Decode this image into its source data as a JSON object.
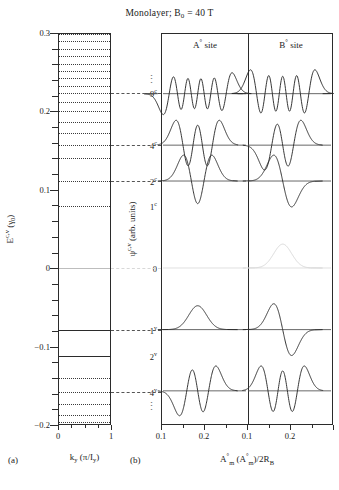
{
  "title": {
    "text": "Monolayer; B",
    "sub": "0",
    "tail": " = 40 T"
  },
  "panel_a": {
    "caption": "(a)",
    "ylabel_main": "E",
    "ylabel_sup": "c,v",
    "ylabel_unit": " (γ",
    "ylabel_unit_sub": "0",
    "ylabel_unit_end": ")",
    "yticks": [
      "0.3",
      "0.2",
      "0.1",
      "0",
      "-0.1",
      "-0.2"
    ],
    "xticks": [
      "0",
      "1"
    ],
    "xtitle_main": "k",
    "xtitle_sub": "y",
    "xtitle_unit": " (π/I",
    "xtitle_unit_sub": "y",
    "xtitle_unit_end": ")"
  },
  "panel_b": {
    "caption": "(b)",
    "site_a_label": "A",
    "site_a_sup": "°",
    "site_a_tail": " site",
    "site_b_label": "B",
    "site_b_sup": "°",
    "site_b_tail": " site",
    "ylabel_main": "ψ",
    "ylabel_sup": "c,v",
    "ylabel_unit": " (arb. units)",
    "xticks_left": [
      "0.1",
      "0.2"
    ],
    "xticks_right": [
      "0.1",
      "0.2"
    ],
    "xtitle_1": "A",
    "xtitle_1_sup": "°",
    "xtitle_1_sub": "m",
    "xtitle_2": " (A",
    "xtitle_2_sup": "°",
    "xtitle_2_sub": "m",
    "xtitle_3": ")/2R",
    "xtitle_3_sub": "B"
  },
  "level_labels": [
    {
      "name": "9",
      "sup": "c"
    },
    {
      "name": "4",
      "sup": "c"
    },
    {
      "name": "2",
      "sup": "c"
    },
    {
      "name": "1",
      "sup": "c"
    },
    {
      "name": "0",
      "sup": ""
    },
    {
      "name": "1",
      "sup": "v"
    },
    {
      "name": "2",
      "sup": "v"
    },
    {
      "name": "4",
      "sup": "v"
    }
  ],
  "chart_data": {
    "type": "line",
    "title": "Monolayer; B0 = 40 T",
    "panels": [
      {
        "id": "a",
        "type": "line",
        "xlabel": "k_y (pi/I_y)",
        "ylabel": "E^{c,v} (gamma_0)",
        "xlim": [
          0,
          1
        ],
        "ylim": [
          -0.2,
          0.3
        ],
        "grid": false,
        "description": "Flat Landau-level energy bands versus k_y",
        "levels": [
          {
            "label": "",
            "energy": 0.299,
            "style": "dotted"
          },
          {
            "label": "",
            "energy": 0.2895,
            "style": "dotted"
          },
          {
            "label": "",
            "energy": 0.28,
            "style": "dotted"
          },
          {
            "label": "",
            "energy": 0.2705,
            "style": "dotted"
          },
          {
            "label": "",
            "energy": 0.261,
            "style": "dotted"
          },
          {
            "label": "",
            "energy": 0.2515,
            "style": "dotted"
          },
          {
            "label": "",
            "energy": 0.242,
            "style": "dotted"
          },
          {
            "label": "",
            "energy": 0.233,
            "style": "dotted"
          },
          {
            "label": "9c",
            "energy": 0.2235,
            "style": "dotted"
          },
          {
            "label": "",
            "energy": 0.212,
            "style": "dotted"
          },
          {
            "label": "",
            "energy": 0.2,
            "style": "dotted"
          },
          {
            "label": "",
            "energy": 0.187,
            "style": "dotted"
          },
          {
            "label": "",
            "energy": 0.173,
            "style": "dotted"
          },
          {
            "label": "4c",
            "energy": 0.1575,
            "style": "dotted"
          },
          {
            "label": "",
            "energy": 0.14,
            "style": "dotted"
          },
          {
            "label": "2c",
            "energy": 0.1115,
            "style": "dotted"
          },
          {
            "label": "1c",
            "energy": 0.079,
            "style": "dotted"
          },
          {
            "label": "0",
            "energy": 0.0,
            "style": "solid-light"
          },
          {
            "label": "1v",
            "energy": -0.079,
            "style": "solid"
          },
          {
            "label": "2v",
            "energy": -0.1115,
            "style": "solid"
          },
          {
            "label": "",
            "energy": -0.14,
            "style": "dotted"
          },
          {
            "label": "4v",
            "energy": -0.1575,
            "style": "dotted"
          },
          {
            "label": "",
            "energy": -0.173,
            "style": "dotted"
          },
          {
            "label": "",
            "energy": -0.187,
            "style": "dotted"
          },
          {
            "label": "",
            "energy": -0.196,
            "style": "dotted"
          }
        ]
      },
      {
        "id": "b",
        "type": "line",
        "xlabel": "A_m^o (A_m^o)/2R_B",
        "ylabel": "psi^{c,v} (arb. units)",
        "xlim": [
          0.05,
          0.26
        ],
        "subpanels": [
          "A° site",
          "B° site"
        ],
        "description": "Landau-level wavefunctions on A and B sublattices; number of nodes grows with level index",
        "states": [
          {
            "level": "9c",
            "baseline_energy": 0.2235,
            "a_nodes": 9,
            "b_nodes": 8,
            "visible": "both"
          },
          {
            "level": "4c",
            "baseline_energy": 0.1575,
            "a_nodes": 4,
            "b_nodes": 3,
            "visible": "both"
          },
          {
            "level": "2c",
            "baseline_energy": 0.1115,
            "a_nodes": 2,
            "b_nodes": 1,
            "visible": "both"
          },
          {
            "level": "0",
            "baseline_energy": 0.0,
            "a_nodes": null,
            "b_nodes": 0,
            "visible": "b-only"
          },
          {
            "level": "1v",
            "baseline_energy": -0.079,
            "a_nodes": 0,
            "b_nodes": 1,
            "visible": "both"
          },
          {
            "level": "4v",
            "baseline_energy": -0.1575,
            "a_nodes": 3,
            "b_nodes": 4,
            "visible": "both"
          }
        ]
      }
    ]
  }
}
